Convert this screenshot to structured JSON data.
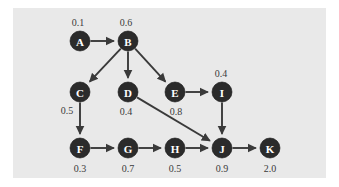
{
  "figure": {
    "type": "directed-graph",
    "background_color": "#e9e9e9",
    "page_color": "#ffffff",
    "node_fill": "#2b2b2b",
    "node_label_color": "#ffffff",
    "weight_label_color": "#3a3a3a",
    "edge_color": "#3a3a3a"
  },
  "nodes": [
    {
      "id": "A",
      "label": "A",
      "weight": "0.1",
      "cx": 80,
      "cy": 41,
      "r": 10,
      "wx": 78,
      "wy": 22
    },
    {
      "id": "B",
      "label": "B",
      "weight": "0.6",
      "cx": 128,
      "cy": 41,
      "r": 10,
      "wx": 126,
      "wy": 22
    },
    {
      "id": "C",
      "label": "C",
      "weight": "0.5",
      "cx": 80,
      "cy": 92,
      "r": 10,
      "wx": 67,
      "wy": 110
    },
    {
      "id": "D",
      "label": "D",
      "weight": "0.4",
      "cx": 128,
      "cy": 92,
      "r": 10,
      "wx": 126,
      "wy": 111
    },
    {
      "id": "E",
      "label": "E",
      "weight": "0.8",
      "cx": 175,
      "cy": 92,
      "r": 10,
      "wx": 176,
      "wy": 111
    },
    {
      "id": "I",
      "label": "I",
      "weight": "0.4",
      "cx": 222,
      "cy": 92,
      "r": 10,
      "wx": 221,
      "wy": 73
    },
    {
      "id": "F",
      "label": "F",
      "weight": "0.3",
      "cx": 80,
      "cy": 148,
      "r": 10,
      "wx": 80,
      "wy": 168
    },
    {
      "id": "G",
      "label": "G",
      "weight": "0.7",
      "cx": 128,
      "cy": 148,
      "r": 10,
      "wx": 128,
      "wy": 168
    },
    {
      "id": "H",
      "label": "H",
      "weight": "0.5",
      "cx": 175,
      "cy": 148,
      "r": 10,
      "wx": 175,
      "wy": 168
    },
    {
      "id": "J",
      "label": "J",
      "weight": "0.9",
      "cx": 222,
      "cy": 148,
      "r": 10,
      "wx": 222,
      "wy": 168
    },
    {
      "id": "K",
      "label": "K",
      "weight": "2.0",
      "cx": 270,
      "cy": 148,
      "r": 10,
      "wx": 270,
      "wy": 168
    }
  ],
  "edges": [
    {
      "id": "A-B",
      "from": "A",
      "to": "B"
    },
    {
      "id": "B-C",
      "from": "B",
      "to": "C"
    },
    {
      "id": "B-D",
      "from": "B",
      "to": "D"
    },
    {
      "id": "B-E",
      "from": "B",
      "to": "E"
    },
    {
      "id": "C-F",
      "from": "C",
      "to": "F"
    },
    {
      "id": "D-J",
      "from": "D",
      "to": "J"
    },
    {
      "id": "E-I",
      "from": "E",
      "to": "I"
    },
    {
      "id": "I-J",
      "from": "I",
      "to": "J"
    },
    {
      "id": "F-G",
      "from": "F",
      "to": "G"
    },
    {
      "id": "G-H",
      "from": "G",
      "to": "H"
    },
    {
      "id": "H-J",
      "from": "H",
      "to": "J"
    },
    {
      "id": "J-K",
      "from": "J",
      "to": "K"
    }
  ]
}
